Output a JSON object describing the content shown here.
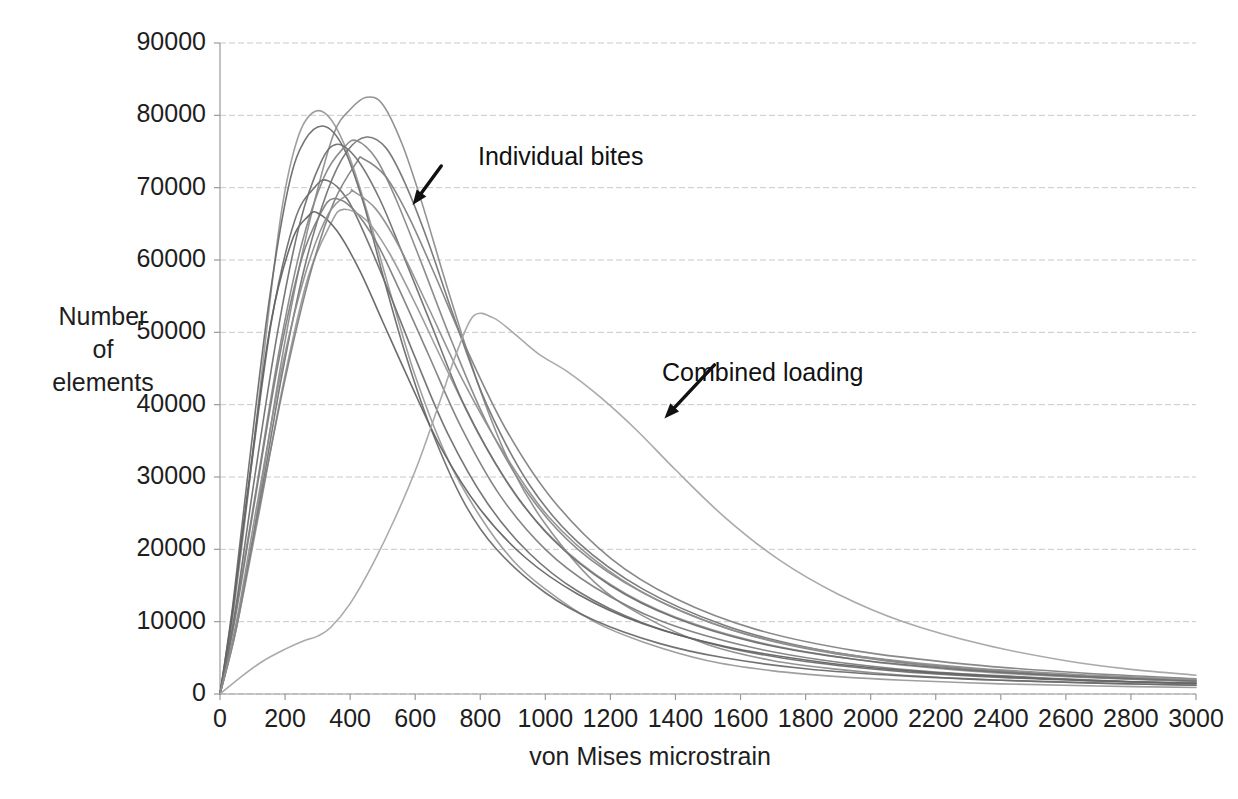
{
  "chart_data": {
    "type": "line",
    "title": "",
    "xlabel": "von Mises microstrain",
    "ylabel": "Number of elements",
    "ylabel_lines": [
      "Number",
      "of",
      "elements"
    ],
    "xlim": [
      0,
      3000
    ],
    "ylim": [
      0,
      90000
    ],
    "xticks": [
      0,
      200,
      400,
      600,
      800,
      1000,
      1200,
      1400,
      1600,
      1800,
      2000,
      2200,
      2400,
      2600,
      2800,
      3000
    ],
    "xtick_labels": [
      "0",
      "200",
      "400",
      "600",
      "800",
      "1000",
      "1200",
      "1400",
      "1600",
      "1800",
      "2000",
      "2200",
      "2400",
      "2600",
      "2800",
      "3000"
    ],
    "yticks": [
      0,
      10000,
      20000,
      30000,
      40000,
      50000,
      60000,
      70000,
      80000,
      90000
    ],
    "ytick_labels": [
      "0",
      "10000",
      "20000",
      "30000",
      "40000",
      "50000",
      "60000",
      "70000",
      "80000",
      "90000"
    ],
    "grid": "horizontal-only",
    "legend": "none",
    "annotations": [
      {
        "text": "Individual bites",
        "label_x": 680,
        "label_y": 73000,
        "arrow_tip_x": 592,
        "arrow_tip_y": 67600
      },
      {
        "text": "Combined loading",
        "label_x": 1520,
        "label_y": 45500,
        "arrow_tip_x": 1366,
        "arrow_tip_y": 38100
      }
    ],
    "series": [
      {
        "name": "Individual bite 1",
        "color": "#9a9a9a",
        "peak_x": 290,
        "peak_y": 80500,
        "x": [
          0,
          40,
          90,
          140,
          190,
          240,
          290,
          340,
          400,
          460,
          520,
          600,
          700,
          800,
          900,
          1000,
          1150,
          1300,
          1500,
          1700,
          1900,
          2100,
          2400,
          2700,
          3000
        ],
        "y": [
          0,
          11000,
          29000,
          49000,
          67000,
          77000,
          80500,
          79500,
          74000,
          65500,
          56000,
          44000,
          32500,
          24500,
          18500,
          14500,
          10000,
          7200,
          4600,
          3200,
          2400,
          1900,
          1400,
          1100,
          900
        ]
      },
      {
        "name": "Individual bite 2",
        "color": "#8d8d8d",
        "peak_x": 450,
        "peak_y": 82500,
        "x": [
          0,
          50,
          110,
          170,
          230,
          290,
          350,
          400,
          450,
          500,
          560,
          620,
          700,
          800,
          900,
          1000,
          1150,
          1300,
          1500,
          1700,
          1900,
          2100,
          2400,
          2700,
          3000
        ],
        "y": [
          0,
          9000,
          24000,
          41000,
          56000,
          68000,
          77500,
          80800,
          82500,
          81500,
          76000,
          68000,
          56000,
          42000,
          31000,
          23500,
          15500,
          10800,
          6800,
          4600,
          3400,
          2600,
          1900,
          1500,
          1200
        ]
      },
      {
        "name": "Individual bite 3",
        "color": "#6b6b6b",
        "peak_x": 320,
        "peak_y": 78500,
        "x": [
          0,
          40,
          90,
          150,
          210,
          260,
          320,
          380,
          440,
          500,
          570,
          650,
          750,
          850,
          1000,
          1150,
          1350,
          1550,
          1800,
          2100,
          2400,
          2700,
          3000
        ],
        "y": [
          0,
          12500,
          32000,
          54000,
          70000,
          76500,
          78500,
          75500,
          68000,
          58000,
          47000,
          36500,
          26500,
          20000,
          14000,
          10200,
          7000,
          5000,
          3500,
          2500,
          1900,
          1500,
          1200
        ]
      },
      {
        "name": "Individual bite 4",
        "color": "#757575",
        "peak_x": 460,
        "peak_y": 77000,
        "x": [
          0,
          50,
          120,
          190,
          260,
          330,
          390,
          450,
          510,
          570,
          640,
          720,
          820,
          950,
          1100,
          1300,
          1550,
          1800,
          2100,
          2400,
          2700,
          3000
        ],
        "y": [
          0,
          9500,
          26000,
          44000,
          59000,
          69500,
          75000,
          77000,
          75500,
          70500,
          62500,
          52000,
          40000,
          29000,
          21000,
          14500,
          9500,
          6500,
          4400,
          3200,
          2400,
          1900
        ]
      },
      {
        "name": "Individual bite 5",
        "color": "#888888",
        "peak_x": 420,
        "peak_y": 76500,
        "x": [
          0,
          45,
          110,
          180,
          250,
          320,
          380,
          420,
          480,
          540,
          620,
          710,
          820,
          950,
          1100,
          1300,
          1550,
          1800,
          2100,
          2400,
          2700,
          3000
        ],
        "y": [
          0,
          10500,
          28000,
          47000,
          62000,
          71500,
          75500,
          76500,
          74000,
          68500,
          59500,
          49000,
          37500,
          27500,
          20000,
          14000,
          9200,
          6300,
          4300,
          3100,
          2300,
          1800
        ]
      },
      {
        "name": "Individual bite 6",
        "color": "#6f6f6f",
        "peak_x": 320,
        "peak_y": 71000,
        "x": [
          0,
          40,
          95,
          160,
          230,
          290,
          330,
          390,
          450,
          520,
          600,
          700,
          820,
          950,
          1100,
          1300,
          1550,
          1800,
          2100,
          2400,
          2700,
          3000
        ],
        "y": [
          0,
          11500,
          31000,
          52000,
          65500,
          70000,
          71000,
          68500,
          63000,
          55500,
          46500,
          36000,
          26500,
          19500,
          14200,
          9800,
          6500,
          4500,
          3100,
          2300,
          1800,
          1400
        ]
      },
      {
        "name": "Individual bite 7",
        "color": "#7e7e7e",
        "peak_x": 350,
        "peak_y": 68500,
        "x": [
          0,
          45,
          110,
          180,
          250,
          310,
          350,
          410,
          480,
          550,
          640,
          740,
          860,
          1000,
          1150,
          1350,
          1600,
          1850,
          2150,
          2450,
          2750,
          3000
        ],
        "y": [
          0,
          10000,
          27500,
          46000,
          60000,
          66500,
          68500,
          67000,
          62500,
          56000,
          47000,
          37000,
          27500,
          20000,
          14800,
          10200,
          6800,
          4700,
          3200,
          2400,
          1800,
          1500
        ]
      },
      {
        "name": "Individual bite 8",
        "color": "#999999",
        "peak_x": 380,
        "peak_y": 67000,
        "x": [
          0,
          50,
          120,
          195,
          270,
          340,
          380,
          450,
          520,
          600,
          690,
          800,
          920,
          1070,
          1250,
          1450,
          1700,
          2000,
          2300,
          2600,
          3000
        ],
        "y": [
          0,
          9000,
          25000,
          43000,
          57500,
          65000,
          67000,
          65500,
          61000,
          54000,
          45500,
          35500,
          26800,
          19500,
          13800,
          9800,
          6700,
          4500,
          3200,
          2400,
          1700
        ]
      },
      {
        "name": "Individual bite 9",
        "color": "#646464",
        "peak_x": 300,
        "peak_y": 66500,
        "x": [
          0,
          40,
          95,
          155,
          220,
          270,
          300,
          360,
          430,
          500,
          580,
          680,
          800,
          940,
          1100,
          1300,
          1550,
          1850,
          2150,
          2500,
          2800,
          3000
        ],
        "y": [
          0,
          12000,
          31500,
          51000,
          62500,
          66000,
          66500,
          64000,
          58500,
          51500,
          43500,
          34000,
          25500,
          18800,
          13800,
          9700,
          6600,
          4400,
          3100,
          2200,
          1700,
          1500
        ]
      },
      {
        "name": "Individual bite 10",
        "color": "#828282",
        "peak_x": 440,
        "peak_y": 74000,
        "x": [
          0,
          50,
          120,
          200,
          280,
          350,
          420,
          440,
          510,
          580,
          660,
          760,
          880,
          1020,
          1200,
          1400,
          1650,
          1950,
          2300,
          2650,
          3000
        ],
        "y": [
          0,
          9200,
          25500,
          43500,
          58500,
          68000,
          73500,
          74000,
          71500,
          66000,
          58000,
          47500,
          36500,
          27000,
          18800,
          13200,
          8900,
          6000,
          4100,
          2900,
          2100
        ]
      },
      {
        "name": "Individual bite 11",
        "color": "#707070",
        "peak_x": 360,
        "peak_y": 76000,
        "x": [
          0,
          45,
          105,
          175,
          245,
          310,
          360,
          420,
          490,
          560,
          650,
          750,
          880,
          1020,
          1200,
          1400,
          1650,
          1950,
          2300,
          2650,
          3000
        ],
        "y": [
          0,
          11000,
          29500,
          49500,
          65000,
          73500,
          76000,
          74000,
          68500,
          61000,
          51000,
          40000,
          29500,
          21500,
          15000,
          10500,
          7100,
          4800,
          3300,
          2400,
          1800
        ]
      },
      {
        "name": "Individual bite 12",
        "color": "#8f8f8f",
        "peak_x": 410,
        "peak_y": 69500,
        "x": [
          0,
          50,
          115,
          190,
          265,
          335,
          400,
          410,
          480,
          555,
          640,
          745,
          870,
          1010,
          1190,
          1390,
          1640,
          1940,
          2290,
          2640,
          3000
        ],
        "y": [
          0,
          9800,
          26500,
          45000,
          58500,
          66500,
          69300,
          69500,
          67000,
          61500,
          53500,
          43500,
          33500,
          24500,
          17200,
          12000,
          8000,
          5400,
          3700,
          2700,
          2000
        ]
      },
      {
        "name": "Combined loading",
        "color": "#a5a5a5",
        "peak_x": 780,
        "peak_y": 52500,
        "shoulder_x": 300,
        "shoulder_y": 8000,
        "x": [
          0,
          60,
          130,
          200,
          260,
          300,
          340,
          400,
          470,
          540,
          610,
          680,
          730,
          780,
          840,
          900,
          980,
          1070,
          1170,
          1280,
          1400,
          1550,
          1720,
          1900,
          2100,
          2350,
          2600,
          2800,
          3000
        ],
        "y": [
          0,
          2200,
          4500,
          6200,
          7400,
          8000,
          9200,
          12500,
          18000,
          24500,
          32000,
          41000,
          47500,
          52300,
          52000,
          50000,
          47000,
          44500,
          41000,
          36500,
          31000,
          24500,
          18500,
          13800,
          10000,
          6800,
          4600,
          3400,
          2600
        ]
      }
    ]
  },
  "axes": {
    "y_title_lines": [
      "Number",
      "of",
      "elements"
    ],
    "x_title": "von Mises microstrain"
  },
  "annotations": {
    "individual": "Individual bites",
    "combined": "Combined loading"
  },
  "colors": {
    "background": "#ffffff",
    "grid": "#c9c9c9",
    "axis": "#9a9a9a",
    "text": "#1e1e1e",
    "arrow": "#111111"
  }
}
